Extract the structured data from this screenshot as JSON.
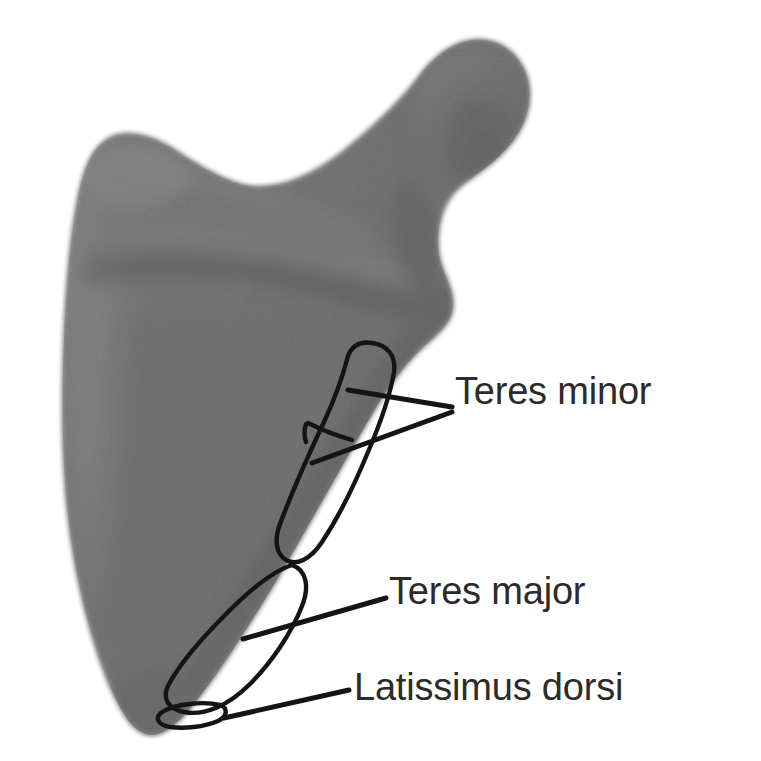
{
  "figure": {
    "background_color": "#ffffff",
    "bone_fill_color": "#6f6f6f",
    "bone_highlight_color": "#8c8c8c",
    "bone_shadow_color": "#5a5a5a",
    "outline_color": "#141414",
    "label_color": "#2b2b2b"
  },
  "labels": [
    {
      "id": "teres-minor",
      "text": "Teres minor",
      "x": 455,
      "y": 372
    },
    {
      "id": "teres-major",
      "text": "Teres major",
      "x": 389,
      "y": 572
    },
    {
      "id": "latissimus-dorsi",
      "text": "Latissimus dorsi",
      "x": 354,
      "y": 668
    }
  ],
  "attachment_regions": [
    {
      "id": "teres-minor-upper",
      "name": "teres minor upper facet"
    },
    {
      "id": "teres-minor-lower",
      "name": "teres minor lower facet"
    },
    {
      "id": "teres-major-oval",
      "name": "teres major oval facet"
    },
    {
      "id": "latissimus-oval",
      "name": "latissimus dorsi small facet"
    }
  ],
  "leader_lines": [
    {
      "id": "leader-teres-minor-upper",
      "from": [
        452,
        408
      ],
      "to": [
        348,
        390
      ]
    },
    {
      "id": "leader-teres-minor-lower",
      "from": [
        452,
        412
      ],
      "to": [
        312,
        463
      ]
    },
    {
      "id": "leader-teres-major",
      "from": [
        386,
        598
      ],
      "to": [
        243,
        639
      ]
    },
    {
      "id": "leader-latissimus",
      "from": [
        349,
        690
      ],
      "to": [
        224,
        718
      ]
    }
  ]
}
